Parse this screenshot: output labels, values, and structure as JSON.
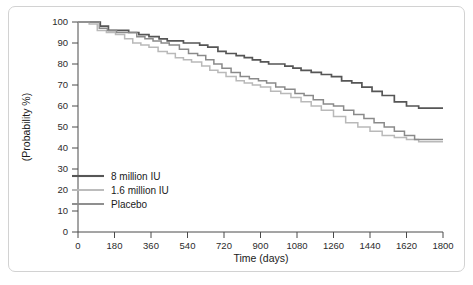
{
  "chart_data": {
    "type": "line",
    "title": "",
    "xlabel": "Time (days)",
    "ylabel": "(Probability %)",
    "xlim": [
      0,
      1800
    ],
    "ylim": [
      0,
      100
    ],
    "xticks": [
      0,
      180,
      360,
      540,
      720,
      900,
      1080,
      1260,
      1440,
      1620,
      1800
    ],
    "yticks": [
      0,
      10,
      20,
      30,
      40,
      50,
      60,
      70,
      80,
      90,
      100
    ],
    "xtick_labels": [
      "0",
      "180",
      "360",
      "540",
      "720",
      "900",
      "1080",
      "1260",
      "1440",
      "1620",
      "1800"
    ],
    "ytick_labels": [
      "0",
      "10",
      "20",
      "30",
      "40",
      "50",
      "60",
      "70",
      "80",
      "90",
      "100"
    ],
    "grid": false,
    "legend_position": "lower-left-inside",
    "step_style": "post",
    "series": [
      {
        "name": "8 million IU",
        "color": "#565656",
        "width": 1.7,
        "x": [
          0,
          60,
          110,
          150,
          200,
          250,
          300,
          350,
          400,
          440,
          480,
          520,
          560,
          600,
          640,
          690,
          730,
          780,
          820,
          860,
          900,
          940,
          980,
          1020,
          1060,
          1100,
          1150,
          1200,
          1250,
          1300,
          1350,
          1400,
          1450,
          1500,
          1560,
          1620,
          1680,
          1800
        ],
        "y": [
          100,
          100,
          98,
          96,
          96,
          95,
          94,
          93,
          92,
          91,
          91,
          90,
          90,
          89,
          88,
          86,
          85,
          84,
          83,
          82,
          81,
          80,
          80,
          79,
          78,
          77,
          76,
          75,
          74,
          72,
          71,
          69,
          67,
          65,
          62,
          60,
          59,
          59
        ]
      },
      {
        "name": "1.6 million IU",
        "color": "#b9b9b9",
        "width": 1.5,
        "x": [
          0,
          55,
          95,
          140,
          185,
          230,
          270,
          310,
          350,
          395,
          440,
          480,
          520,
          560,
          610,
          650,
          690,
          730,
          780,
          820,
          860,
          900,
          950,
          1000,
          1050,
          1100,
          1150,
          1200,
          1260,
          1320,
          1380,
          1440,
          1500,
          1560,
          1620,
          1680,
          1800
        ],
        "y": [
          100,
          99,
          96,
          95,
          94,
          92,
          90,
          89,
          88,
          86,
          85,
          83,
          82,
          81,
          79,
          77,
          76,
          74,
          72,
          71,
          70,
          69,
          67,
          66,
          64,
          62,
          60,
          58,
          55,
          52,
          50,
          48,
          46,
          45,
          44,
          43,
          43
        ]
      },
      {
        "name": "Placebo",
        "color": "#8a8a8a",
        "width": 1.5,
        "x": [
          0,
          60,
          105,
          145,
          190,
          240,
          290,
          330,
          370,
          410,
          450,
          500,
          545,
          590,
          630,
          670,
          710,
          755,
          800,
          845,
          890,
          930,
          975,
          1020,
          1070,
          1115,
          1160,
          1210,
          1260,
          1310,
          1360,
          1410,
          1460,
          1510,
          1560,
          1610,
          1660,
          1800
        ],
        "y": [
          100,
          100,
          97,
          96,
          95,
          95,
          93,
          92,
          91,
          90,
          89,
          87,
          85,
          84,
          82,
          80,
          78,
          76,
          74,
          73,
          72,
          71,
          69,
          68,
          66,
          65,
          63,
          61,
          60,
          58,
          56,
          54,
          52,
          50,
          48,
          46,
          44,
          44
        ]
      }
    ]
  },
  "legend": {
    "entries": [
      {
        "label": "8 million IU"
      },
      {
        "label": "1.6 million IU"
      },
      {
        "label": "Placebo"
      }
    ]
  }
}
